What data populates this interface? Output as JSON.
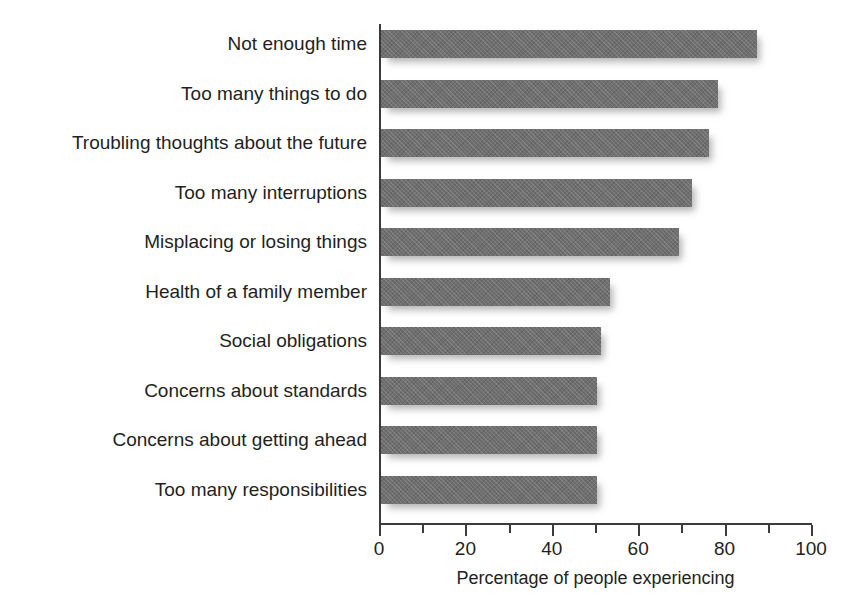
{
  "figure": {
    "clipped_caption": "Figure 1 Sources of everyday stress"
  },
  "chart_data": {
    "type": "bar",
    "orientation": "horizontal",
    "title": "",
    "xlabel": "Percentage of people experiencing",
    "ylabel": "",
    "xlim": [
      0,
      100
    ],
    "grid": false,
    "legend": null,
    "bar_color": "#6f6f6f",
    "axis_color": "#3b3b3b",
    "text_color": "#231f20",
    "major_ticks": [
      0,
      20,
      40,
      60,
      80,
      100
    ],
    "minor_ticks": [
      10,
      30,
      50,
      70,
      90
    ],
    "tick_labels": [
      "0",
      "20",
      "40",
      "60",
      "80",
      "100"
    ],
    "categories": [
      "Not enough time",
      "Too many things to do",
      "Troubling thoughts about the future",
      "Too many interruptions",
      "Misplacing or losing things",
      "Health of a family member",
      "Social obligations",
      "Concerns about standards",
      "Concerns about getting ahead",
      "Too many responsibilities"
    ],
    "values": [
      87,
      78,
      76,
      72,
      69,
      53,
      51,
      50,
      50,
      50
    ]
  }
}
